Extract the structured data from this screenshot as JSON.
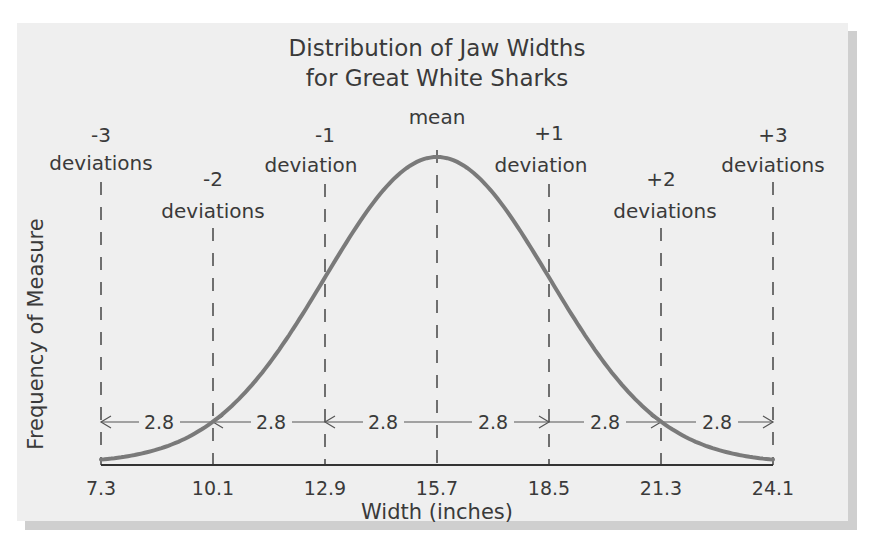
{
  "chart_data": {
    "type": "line",
    "title": "Distribution of Jaw Widths for Great White Sharks",
    "title_lines": [
      "Distribution of Jaw Widths",
      "for Great White Sharks"
    ],
    "xlabel": "Width (inches)",
    "ylabel": "Frequency of Measure",
    "x_ticks": [
      "7.3",
      "10.1",
      "12.9",
      "15.7",
      "18.5",
      "21.3",
      "24.1"
    ],
    "xlim": [
      7.3,
      24.1
    ],
    "mean": 15.7,
    "standard_deviation": 2.8,
    "distribution": "normal",
    "curve_color": "#7a7a7a",
    "deviation_labels": [
      {
        "number": "-3",
        "text": "deviations",
        "x": 7.3
      },
      {
        "number": "-2",
        "text": "deviations",
        "x": 10.1
      },
      {
        "number": "-1",
        "text": "deviation",
        "x": 12.9
      },
      {
        "number": "mean",
        "text": "",
        "x": 15.7
      },
      {
        "number": "+1",
        "text": "deviation",
        "x": 18.5
      },
      {
        "number": "+2",
        "text": "deviations",
        "x": 21.3
      },
      {
        "number": "+3",
        "text": "deviations",
        "x": 24.1
      }
    ],
    "interval_labels": [
      "2.8",
      "2.8",
      "2.8",
      "2.8",
      "2.8",
      "2.8"
    ],
    "grid": false,
    "legend": null
  }
}
